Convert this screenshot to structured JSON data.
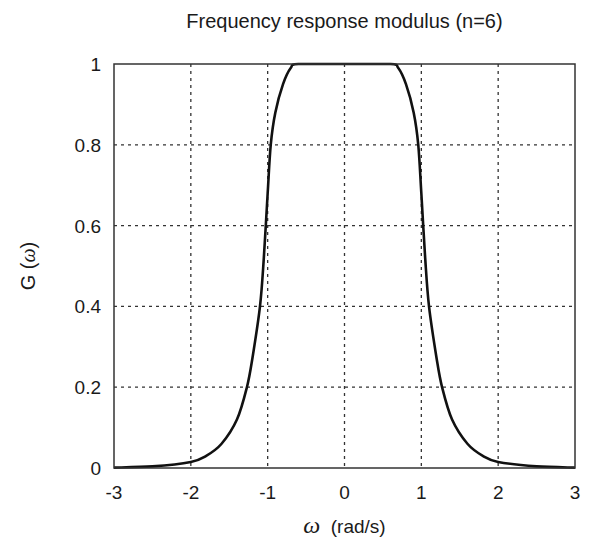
{
  "chart_data": {
    "type": "line",
    "title": "Frequency response modulus (n=6)",
    "xlabel": "ω (rad/s)",
    "ylabel": "G (ω)",
    "xlim": [
      -3,
      3
    ],
    "ylim": [
      0,
      1
    ],
    "grid": true,
    "xticks": [
      "-3",
      "-2",
      "-1",
      "0",
      "1",
      "2",
      "3"
    ],
    "yticks": [
      "0",
      "0.2",
      "0.4",
      "0.6",
      "0.8",
      "1"
    ],
    "series": [
      {
        "name": "G(ω)",
        "color": "#111111",
        "x": [
          -3,
          -2.5,
          -2.0,
          -1.8,
          -1.6,
          -1.4,
          -1.27,
          -1.2,
          -1.1,
          -1.05,
          -1.0,
          -0.96,
          -0.9,
          -0.8,
          -0.7,
          -0.6,
          0,
          0.6,
          0.7,
          0.8,
          0.9,
          0.96,
          1.0,
          1.05,
          1.1,
          1.2,
          1.27,
          1.4,
          1.6,
          1.8,
          2.0,
          2.5,
          3
        ],
        "y": [
          0.001,
          0.004,
          0.015,
          0.03,
          0.06,
          0.12,
          0.2,
          0.27,
          0.4,
          0.52,
          0.68,
          0.8,
          0.88,
          0.95,
          0.99,
          1.0,
          1.0,
          1.0,
          0.99,
          0.95,
          0.88,
          0.8,
          0.68,
          0.52,
          0.4,
          0.27,
          0.2,
          0.12,
          0.06,
          0.03,
          0.015,
          0.004,
          0.001
        ]
      }
    ]
  },
  "title": "Frequency response modulus (n=6)",
  "axes": {
    "xlabel_symbol": "ω",
    "xlabel_unit": "(rad/s)",
    "ylabel_prefix": "G (",
    "ylabel_symbol": "ω",
    "ylabel_suffix": ")"
  }
}
